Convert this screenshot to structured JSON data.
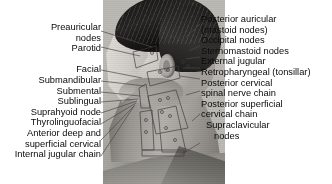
{
  "figure": {
    "photo": {
      "subject": "man-head-neck-left-profile",
      "description": "grayscale photograph of a man's head and neck in left lateral profile with lymph node chains drawn on the skin"
    },
    "colors": {
      "background": "#ffffff",
      "text": "#0a0a0a",
      "leader_line": "#4a4a4a",
      "overlay_marking": "#3b3b3b"
    }
  },
  "labels_left": [
    {
      "id": "preauricular-nodes",
      "lines": [
        "Preauricular",
        "nodes"
      ]
    },
    {
      "id": "parotid",
      "lines": [
        "Parotid"
      ]
    },
    {
      "id": "facial",
      "lines": [
        "Facial"
      ]
    },
    {
      "id": "submandibular",
      "lines": [
        "Submandibular"
      ]
    },
    {
      "id": "submental",
      "lines": [
        "Submental"
      ]
    },
    {
      "id": "sublingual",
      "lines": [
        "Sublingual"
      ]
    },
    {
      "id": "suprahyoid-node",
      "lines": [
        "Suprahyoid node"
      ]
    },
    {
      "id": "thyrolinguofacial",
      "lines": [
        "Thyrolinguofacial"
      ]
    },
    {
      "id": "anterior-deep-and-superficial-cervical",
      "lines": [
        "Anterior deep and",
        "superficial cervical"
      ]
    },
    {
      "id": "internal-jugular-chain",
      "lines": [
        "Internal jugular chain"
      ]
    }
  ],
  "labels_right": [
    {
      "id": "posterior-auricular-mastoid-nodes",
      "lines": [
        "Posterior auricular",
        "(mastoid nodes)"
      ]
    },
    {
      "id": "occipital-nodes",
      "lines": [
        "Occipital nodes"
      ]
    },
    {
      "id": "sternomastoid-nodes",
      "lines": [
        "Sternomastoid nodes"
      ]
    },
    {
      "id": "external-jugular",
      "lines": [
        "External jugular"
      ]
    },
    {
      "id": "retropharyngeal-tonsillar",
      "lines": [
        "Retropharyngeal (tonsillar)"
      ]
    },
    {
      "id": "posterior-cervical-spinal-nerve-chain",
      "lines": [
        "Posterior cervical",
        "spinal nerve chain"
      ]
    },
    {
      "id": "posterior-superficial-cervical-chain",
      "lines": [
        "Posterior superficial",
        "cervical chain"
      ]
    },
    {
      "id": "supraclavicular-nodes",
      "lines": [
        "Supraclavicular",
        "nodes"
      ]
    }
  ],
  "left_label_text": {
    "l0a": "Preauricular",
    "l0b": "nodes",
    "l1": "Parotid",
    "l2": "Facial",
    "l3": "Submandibular",
    "l4": "Submental",
    "l5": "Sublingual",
    "l6": "Suprahyoid node",
    "l7": "Thyrolinguofacial",
    "l8a": "Anterior deep and",
    "l8b": "superficial cervical",
    "l9": "Internal jugular chain"
  },
  "right_label_text": {
    "r0a": "Posterior auricular",
    "r0b": "(mastoid nodes)",
    "r1": "Occipital nodes",
    "r2": "Sternomastoid nodes",
    "r3": "External jugular",
    "r4": "Retropharyngeal (tonsillar)",
    "r5a": "Posterior cervical",
    "r5b": "spinal nerve chain",
    "r6a": "Posterior superficial",
    "r6b": "cervical chain",
    "r7a": "Supraclavicular",
    "r7b": "nodes"
  }
}
